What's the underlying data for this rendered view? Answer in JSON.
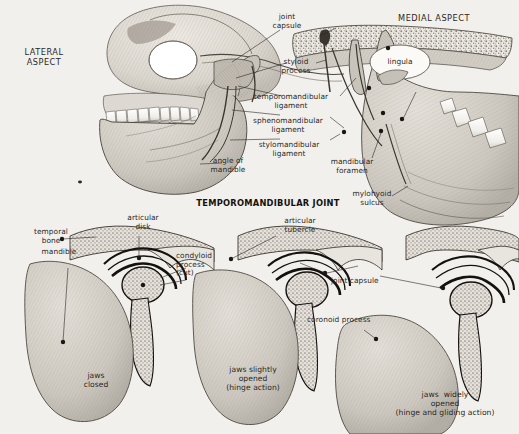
{
  "plate": {
    "title": "TEMPOROMANDIBULAR JOINT",
    "background_color": "#f2f0ec",
    "ink_color": "#2b2825",
    "bone_fill": "#d8d4cd",
    "cancellous_fill": "#e9e6e0"
  },
  "views": {
    "lateral": {
      "heading": "LATERAL\nASPECT"
    },
    "medial": {
      "heading": "MEDIAL ASPECT"
    }
  },
  "labels": {
    "joint_capsule_top": "joint\ncapsule",
    "styloid_process": "styloid\nprocess",
    "temporomandibular_ligament": "temporomandibular\nligament",
    "sphenomandibular_ligament": "sphenomandibular\nligament",
    "stylomandibular_ligament": "stylomandibular\nligament",
    "angle_of_mandible": "angle of\nmandible",
    "mandibular_foramen": "mandibular\nforamen",
    "lingula": "lingula",
    "mylohyoid_sulcus": "mylohyoid\nsulcus",
    "temporal_bone": "temporal\nbone",
    "mandible": "mandible",
    "articular_disk": "articular\ndisk",
    "condyloid_process": "condyloid\nprocess\n(cut)",
    "articular_tubercle": "articular\ntubercle",
    "joint_capsule_detail": "joint capsule",
    "coronoid_process": "coronoid process"
  },
  "captions": {
    "panel1": "jaws\nclosed",
    "panel2": "jaws slightly\nopened\n(hinge action)",
    "panel3": "jaws  widely\nopened\n(hinge and gliding action)"
  }
}
